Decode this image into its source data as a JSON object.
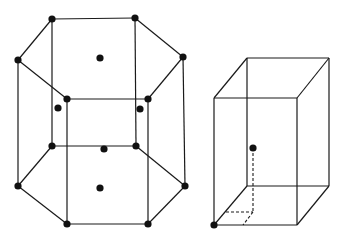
{
  "figure": {
    "colors": {
      "line": "#1a1a1a",
      "atom": "#111111",
      "background": "#ffffff"
    }
  },
  "hexagonal_cell": {
    "label": "hexagonal-prism",
    "top_face": [
      [
        52,
        19
      ],
      [
        135,
        18
      ],
      [
        183,
        57
      ],
      [
        148,
        99
      ],
      [
        67,
        99
      ],
      [
        18,
        60
      ]
    ],
    "bottom_face": [
      [
        52,
        146
      ],
      [
        136,
        146
      ],
      [
        185,
        186
      ],
      [
        148,
        224
      ],
      [
        67,
        224
      ],
      [
        18,
        186
      ]
    ],
    "corner_atoms": [
      [
        52,
        19
      ],
      [
        135,
        18
      ],
      [
        183,
        57
      ],
      [
        148,
        99
      ],
      [
        67,
        99
      ],
      [
        18,
        60
      ],
      [
        52,
        146
      ],
      [
        136,
        146
      ],
      [
        185,
        186
      ],
      [
        148,
        224
      ],
      [
        67,
        224
      ],
      [
        18,
        186
      ]
    ],
    "face_center_atoms": [
      [
        100,
        58
      ],
      [
        100,
        188
      ]
    ],
    "interior_atoms": [
      [
        58,
        108
      ],
      [
        140,
        109
      ],
      [
        104,
        149
      ]
    ]
  },
  "rectangular_cell": {
    "label": "rectangular-prism",
    "back_top": [
      [
        247,
        58
      ],
      [
        329,
        58
      ]
    ],
    "front_top": [
      [
        214,
        98
      ],
      [
        297,
        98
      ]
    ],
    "front_bottom": [
      [
        214,
        225
      ],
      [
        297,
        225
      ]
    ],
    "back_bottom": [
      [
        247,
        186
      ],
      [
        329,
        186
      ]
    ],
    "atoms": [
      [
        214,
        225
      ],
      [
        253,
        148
      ]
    ],
    "dashed_guides": [
      [
        [
          253,
          148
        ],
        [
          253,
          212
        ]
      ],
      [
        [
          226,
          212
        ],
        [
          253,
          212
        ]
      ],
      [
        [
          253,
          212
        ],
        [
          243,
          225
        ]
      ]
    ]
  }
}
